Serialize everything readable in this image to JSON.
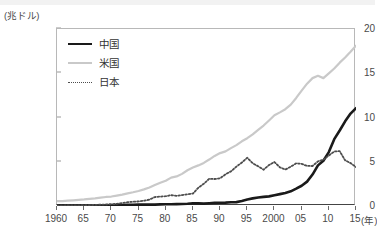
{
  "chart_data": {
    "type": "line",
    "title": "",
    "xlabel": "年",
    "ylabel": "兆ドル",
    "y_unit_label": "(兆ドル)",
    "x_unit_label": "(年)",
    "xlim": [
      1960,
      2015
    ],
    "ylim": [
      0,
      20
    ],
    "yticks": [
      0,
      5,
      10,
      15,
      20
    ],
    "ytick_labels": [
      "0",
      "5",
      "10",
      "15",
      "20"
    ],
    "xticks": [
      1960,
      1965,
      1970,
      1975,
      1980,
      1985,
      1990,
      1995,
      2000,
      2005,
      2010,
      2015
    ],
    "xtick_labels": [
      "1960",
      "65",
      "70",
      "75",
      "80",
      "85",
      "90",
      "95",
      "2000",
      "05",
      "10",
      "15"
    ],
    "grid": false,
    "legend_position": "top-left",
    "x": [
      1960,
      1961,
      1962,
      1963,
      1964,
      1965,
      1966,
      1967,
      1968,
      1969,
      1970,
      1971,
      1972,
      1973,
      1974,
      1975,
      1976,
      1977,
      1978,
      1979,
      1980,
      1981,
      1982,
      1983,
      1984,
      1985,
      1986,
      1987,
      1988,
      1989,
      1990,
      1991,
      1992,
      1993,
      1994,
      1995,
      1996,
      1997,
      1998,
      1999,
      2000,
      2001,
      2002,
      2003,
      2004,
      2005,
      2006,
      2007,
      2008,
      2009,
      2010,
      2011,
      2012,
      2013,
      2014,
      2015
    ],
    "series": [
      {
        "name": "中国",
        "key": "china",
        "color": "#1a1a1a",
        "style": "solid",
        "width": 2.6,
        "values": [
          0.06,
          0.05,
          0.05,
          0.06,
          0.06,
          0.07,
          0.08,
          0.07,
          0.07,
          0.08,
          0.09,
          0.1,
          0.11,
          0.14,
          0.14,
          0.16,
          0.15,
          0.17,
          0.15,
          0.18,
          0.19,
          0.2,
          0.21,
          0.23,
          0.26,
          0.31,
          0.3,
          0.27,
          0.31,
          0.35,
          0.36,
          0.38,
          0.42,
          0.44,
          0.56,
          0.73,
          0.86,
          0.96,
          1.03,
          1.09,
          1.21,
          1.34,
          1.47,
          1.66,
          1.96,
          2.29,
          2.75,
          3.55,
          4.59,
          5.11,
          6.09,
          7.55,
          8.53,
          9.57,
          10.44,
          11.06
        ]
      },
      {
        "name": "米国",
        "key": "usa",
        "color": "#c9c9c9",
        "style": "solid",
        "width": 2.2,
        "values": [
          0.54,
          0.56,
          0.6,
          0.64,
          0.69,
          0.74,
          0.81,
          0.86,
          0.94,
          1.02,
          1.07,
          1.17,
          1.28,
          1.43,
          1.55,
          1.69,
          1.88,
          2.09,
          2.36,
          2.63,
          2.86,
          3.21,
          3.34,
          3.63,
          4.04,
          4.35,
          4.59,
          4.87,
          5.25,
          5.66,
          5.98,
          6.17,
          6.54,
          6.88,
          7.31,
          7.66,
          8.1,
          8.61,
          9.09,
          9.66,
          10.25,
          10.58,
          10.94,
          11.46,
          12.21,
          13.04,
          13.82,
          14.45,
          14.71,
          14.45,
          14.99,
          15.54,
          16.2,
          16.78,
          17.42,
          18.12
        ]
      },
      {
        "name": "日本",
        "key": "japan",
        "color": "#4d4d4d",
        "style": "dotted",
        "width": 1.8,
        "values": [
          0.04,
          0.05,
          0.06,
          0.07,
          0.08,
          0.09,
          0.11,
          0.12,
          0.15,
          0.17,
          0.21,
          0.24,
          0.32,
          0.43,
          0.48,
          0.52,
          0.59,
          0.72,
          1.01,
          1.06,
          1.11,
          1.22,
          1.14,
          1.24,
          1.32,
          1.4,
          2.07,
          2.51,
          3.07,
          3.05,
          3.13,
          3.58,
          3.91,
          4.45,
          4.91,
          5.45,
          4.83,
          4.49,
          4.1,
          4.63,
          4.97,
          4.37,
          4.12,
          4.45,
          4.82,
          4.76,
          4.53,
          4.52,
          5.04,
          5.23,
          5.7,
          6.16,
          6.2,
          5.16,
          4.85,
          4.39
        ]
      }
    ]
  },
  "legend": {
    "items": [
      {
        "label": "中国",
        "key": "china"
      },
      {
        "label": "米国",
        "key": "usa"
      },
      {
        "label": "日本",
        "key": "japan"
      }
    ]
  }
}
